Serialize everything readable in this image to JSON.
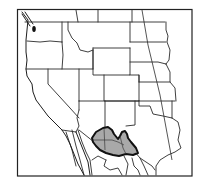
{
  "map": {
    "type": "range-map",
    "region": "Western United States and northern Mexico",
    "colors": {
      "background": "#ffffff",
      "frame": "#222222",
      "borders": "#2a2a2a",
      "range_fill": "#a9a9a9",
      "range_outline": "#111111"
    },
    "highlighted_area": {
      "label": "range",
      "location": "southeastern Arizona, southwestern New Mexico, northern Mexico"
    }
  }
}
